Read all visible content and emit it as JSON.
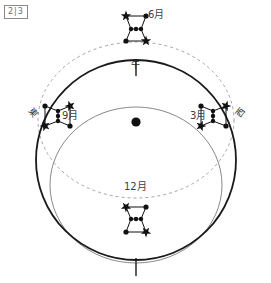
{
  "figure": {
    "tag": "2|3",
    "title": "",
    "center_marker": "observer-earth-dot"
  },
  "directions": {
    "south": "午",
    "east": "東",
    "west": "西"
  },
  "months": [
    {
      "key": "jun",
      "label": "6月",
      "position": "top",
      "x": 148,
      "y": 14,
      "star_x": 136,
      "star_y": 28,
      "rotation": 0
    },
    {
      "key": "sep",
      "label": "9月",
      "position": "left",
      "x": 62,
      "y": 114,
      "star_x": 57,
      "star_y": 116,
      "rotation": -90
    },
    {
      "key": "mar",
      "label": "3月",
      "position": "right",
      "x": 192,
      "y": 114,
      "star_x": 214,
      "star_y": 116,
      "rotation": 90
    },
    {
      "key": "dec",
      "label": "12月",
      "position": "bottom",
      "x": 126,
      "y": 186,
      "star_x": 136,
      "star_y": 220,
      "rotation": 180
    }
  ],
  "colors": {
    "horizon_stroke": "#1a1a1a",
    "inner_ellipse_stroke": "#6b6b6b",
    "dashed_orbit_stroke": "#9a9a9a",
    "star_fill": "#111111",
    "label_text": "#3d3d3d",
    "tag_text": "#6f6f6f",
    "background": "#ffffff"
  },
  "geometry": {
    "horizon_circle": {
      "cx": 136,
      "cy": 160,
      "r": 100,
      "stroke_width": 1.8
    },
    "inner_ellipse": {
      "cx": 136,
      "cy": 185,
      "rx": 86,
      "ry": 78,
      "stroke_width": 0.8
    },
    "dashed_ellipse": {
      "cx": 136,
      "cy": 120,
      "rx": 98,
      "ry": 78,
      "stroke_width": 0.9,
      "dash": "3,3"
    },
    "meridian_tick_top": {
      "x": 136,
      "y1": 60,
      "y2": 76
    },
    "meridian_tick_bottom": {
      "x": 136,
      "y1": 258,
      "y2": 276
    }
  },
  "constellation": {
    "name": "orion",
    "stars": [
      {
        "id": "s1",
        "type": "star",
        "dx": -10,
        "dy": -12
      },
      {
        "id": "s2",
        "type": "dot",
        "dx": 10,
        "dy": -12
      },
      {
        "id": "s3",
        "type": "belt1",
        "dx": -5,
        "dy": 1
      },
      {
        "id": "s4",
        "type": "belt2",
        "dx": 0,
        "dy": 1
      },
      {
        "id": "s5",
        "type": "belt3",
        "dx": 5,
        "dy": 1
      },
      {
        "id": "s6",
        "type": "dot",
        "dx": -10,
        "dy": 13
      },
      {
        "id": "s7",
        "type": "star",
        "dx": 10,
        "dy": 13
      }
    ]
  }
}
